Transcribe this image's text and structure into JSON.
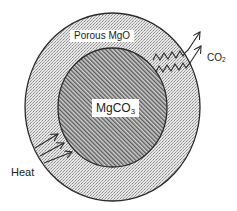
{
  "diagram": {
    "shell_label": "Porous MgO",
    "core_label_base": "MgCO",
    "core_label_sub": "3",
    "heat_label": "Heat",
    "gas_label_base": "CO",
    "gas_label_sub": "2"
  },
  "colors": {
    "background": "#ffffff",
    "outline": "#2a2a2a",
    "shell_fill": "#d9d9d9",
    "core_fill": "#9a9a9a",
    "text": "#222222"
  },
  "arrows": {
    "heat_count": 3,
    "co2_count": 2
  }
}
